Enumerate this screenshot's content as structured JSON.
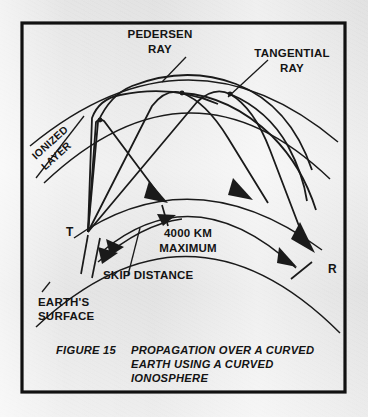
{
  "figure": {
    "background_color": "#e9e9e9",
    "ink_color": "#1a1a1a",
    "frame_color": "#111111"
  },
  "labels": {
    "pedersen_ray_line1": "PEDERSEN",
    "pedersen_ray_line2": "RAY",
    "tangential_ray_line1": "TANGENTIAL",
    "tangential_ray_line2": "RAY",
    "ionized_layer_line1": "IONIZED",
    "ionized_layer_line2": "LAYER",
    "earths_surface_line1": "EARTH'S",
    "earths_surface_line2": "SURFACE",
    "skip_distance": "SKIP DISTANCE",
    "max_range_line1": "4000 KM",
    "max_range_line2": "MAXIMUM",
    "transmitter": "T",
    "receiver": "R"
  },
  "caption": {
    "number": "FIGURE 15",
    "line1": "PROPAGATION OVER A CURVED",
    "line2": "EARTH USING A CURVED",
    "line3": "IONOSPHERE"
  }
}
